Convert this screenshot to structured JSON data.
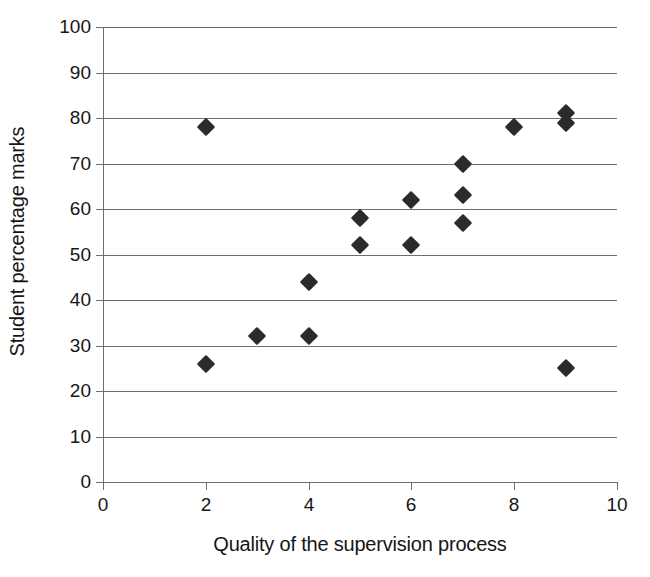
{
  "chart_data": {
    "type": "scatter",
    "title": "",
    "xlabel": "Quality of the supervision process",
    "ylabel": "Student percentage marks",
    "xlim": [
      0,
      10
    ],
    "ylim": [
      0,
      100
    ],
    "xticks": [
      0,
      2,
      4,
      6,
      8,
      10
    ],
    "yticks": [
      0,
      10,
      20,
      30,
      40,
      50,
      60,
      70,
      80,
      90,
      100
    ],
    "xtick_labels": [
      "0",
      "2",
      "4",
      "6",
      "8",
      "10"
    ],
    "ytick_labels": [
      "0",
      "10",
      "20",
      "30",
      "40",
      "50",
      "60",
      "70",
      "80",
      "90",
      "100"
    ],
    "grid": "horizontal",
    "legend": "none",
    "marker_shape": "diamond",
    "marker_color": "#2b2b2b",
    "axis_color": "#6f6f6f",
    "points": [
      {
        "x": 2,
        "y": 78
      },
      {
        "x": 2,
        "y": 26
      },
      {
        "x": 3,
        "y": 32
      },
      {
        "x": 4,
        "y": 44
      },
      {
        "x": 4,
        "y": 32
      },
      {
        "x": 5,
        "y": 58
      },
      {
        "x": 5,
        "y": 52
      },
      {
        "x": 6,
        "y": 62
      },
      {
        "x": 6,
        "y": 52
      },
      {
        "x": 7,
        "y": 70
      },
      {
        "x": 7,
        "y": 63
      },
      {
        "x": 7,
        "y": 57
      },
      {
        "x": 8,
        "y": 78
      },
      {
        "x": 9,
        "y": 81
      },
      {
        "x": 9,
        "y": 79
      },
      {
        "x": 9,
        "y": 25
      }
    ]
  }
}
